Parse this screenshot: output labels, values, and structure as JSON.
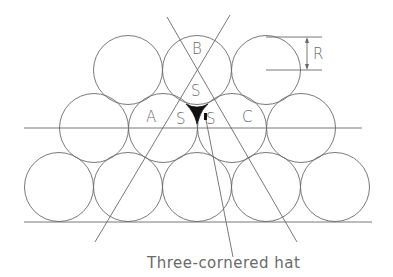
{
  "diagram": {
    "title": "Three-cornered hat",
    "caption": "Three-cornered hat",
    "radius_label": "R",
    "radius": 34.5,
    "colors": {
      "line": "#6a6a6a",
      "hat": "#111111",
      "background": "#ffffff"
    },
    "rows": {
      "top": {
        "cy": 70,
        "cx": [
          128,
          197,
          266
        ]
      },
      "middle": {
        "cy": 128,
        "cx": [
          94,
          163,
          232,
          301
        ]
      },
      "bottom": {
        "cy": 187,
        "cx": [
          59,
          128,
          197,
          266,
          335
        ]
      }
    },
    "labels": [
      {
        "text": "B",
        "x": 192,
        "y": 54
      },
      {
        "text": "S",
        "x": 191,
        "y": 96
      },
      {
        "text": "A",
        "x": 146,
        "y": 122
      },
      {
        "text": "S",
        "x": 176,
        "y": 124
      },
      {
        "text": "S",
        "x": 206,
        "y": 124
      },
      {
        "text": "C",
        "x": 242,
        "y": 122
      }
    ],
    "lines": {
      "horizontal_mid": {
        "x1": 24,
        "y1": 128,
        "x2": 362,
        "y2": 128
      },
      "horizontal_base": {
        "x1": 24,
        "y1": 222,
        "x2": 372,
        "y2": 222
      },
      "diag_backslash": {
        "x1": 167,
        "y1": 17,
        "x2": 297,
        "y2": 242
      },
      "diag_slash": {
        "x1": 230,
        "y1": 15,
        "x2": 95,
        "y2": 242
      },
      "leader": {
        "x1": 206,
        "y1": 120,
        "x2": 233,
        "y2": 257
      }
    }
  }
}
